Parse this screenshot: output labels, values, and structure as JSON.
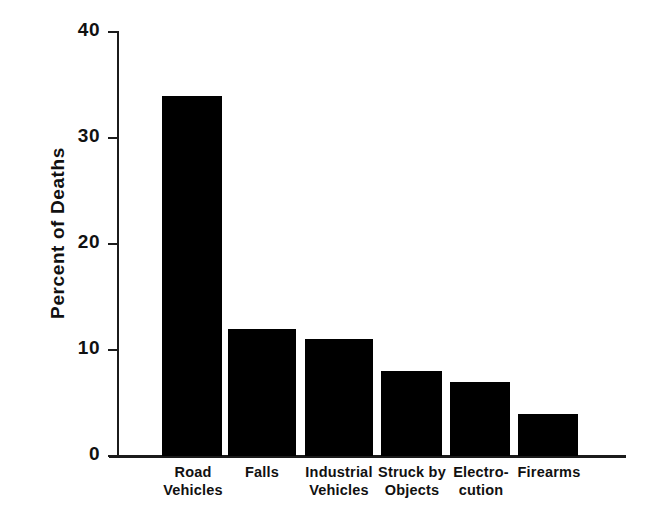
{
  "chart_data": {
    "type": "bar",
    "title": "",
    "subtitle": "",
    "xlabel": "",
    "ylabel": "Percent of Deaths",
    "ylim": [
      0,
      40
    ],
    "yticks": [
      0,
      10,
      20,
      30,
      40
    ],
    "ytick_labels": [
      "0",
      "10",
      "20",
      "30",
      "40"
    ],
    "grid": false,
    "legend": false,
    "legend_position": "none",
    "bar_color": "#000000",
    "background_color": "#ffffff",
    "categories": [
      "Road Vehicles",
      "Falls",
      "Industrial Vehicles",
      "Struck by Objects",
      "Electro-cution",
      "Firearms"
    ],
    "category_lines": [
      [
        "Road",
        "Vehicles"
      ],
      [
        "Falls",
        ""
      ],
      [
        "Industrial",
        "Vehicles"
      ],
      [
        "Struck by",
        "Objects"
      ],
      [
        "Electro-",
        "cution"
      ],
      [
        "Firearms",
        ""
      ]
    ],
    "values": [
      34,
      12,
      11,
      8,
      7,
      4
    ]
  },
  "axes": {
    "y_label": "Percent of Deaths"
  }
}
